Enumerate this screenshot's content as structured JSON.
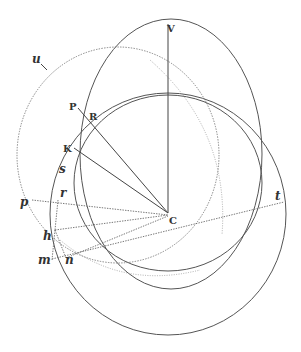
{
  "figure": {
    "colors": {
      "ink": "#444444",
      "background": "#ffffff"
    },
    "labels": {
      "V": "V",
      "P": "P",
      "R": "R",
      "K": "K",
      "s": "s",
      "r": "r",
      "p": "p",
      "h": "h",
      "m": "m",
      "n": "n",
      "C": "C",
      "t": "t",
      "u": "u"
    }
  }
}
